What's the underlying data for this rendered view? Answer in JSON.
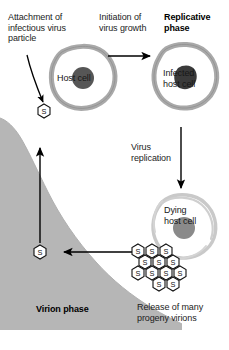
{
  "diagram": {
    "title_semantic": "virus-replication-cycle",
    "labels": {
      "attachment": "Attachment of\ninfectious virus\nparticle",
      "initiation": "Initiation of\nvirus growth",
      "replicative_phase": "Replicative\nphase",
      "host_cell": "Host cell",
      "infected_host_cell": "Infected\nhost cell",
      "virus_replication": "Virus\nreplication",
      "dying_host_cell": "Dying\nhost cell",
      "release": "Release of many\nprogeny virions",
      "virion_phase": "Virion phase"
    },
    "virion_glyph": "S",
    "colors": {
      "background": "#ffffff",
      "gray_field": "#b6b6b6",
      "cell_membrane": "#a9a9a9",
      "cell_membrane_light": "#c9c9c9",
      "nucleus_host": "#565656",
      "nucleus_infected": "#3a3a3a",
      "nucleus_dying": "#8a8a8a",
      "arrow": "#000000",
      "text": "#1a1a1a"
    },
    "virion_cluster_rows": [
      {
        "count": 3,
        "y": 250,
        "x_start": 138,
        "step": 14
      },
      {
        "count": 3,
        "y": 261,
        "x_start": 145,
        "step": 14
      },
      {
        "count": 4,
        "y": 272,
        "x_start": 138,
        "step": 14
      },
      {
        "count": 2,
        "y": 283,
        "x_start": 159,
        "step": 14
      }
    ],
    "free_virions": [
      {
        "name": "attaching-virion",
        "x": 44,
        "y": 111
      },
      {
        "name": "released-virion",
        "x": 40,
        "y": 252
      }
    ],
    "arrows": [
      {
        "name": "arrow-attachment",
        "type": "curved",
        "from": "attachment-label",
        "to": "attaching-virion"
      },
      {
        "name": "arrow-initiation",
        "type": "straight-right",
        "x1": 108,
        "y1": 56,
        "x2": 150,
        "y2": 56
      },
      {
        "name": "arrow-replication",
        "type": "straight-down",
        "x1": 181,
        "y1": 127,
        "x2": 181,
        "y2": 186
      },
      {
        "name": "arrow-release",
        "type": "straight-left",
        "x1": 130,
        "y1": 252,
        "x2": 62,
        "y2": 252
      },
      {
        "name": "arrow-virion-phase",
        "type": "straight-up",
        "x1": 40,
        "y1": 243,
        "x2": 40,
        "y2": 150
      }
    ]
  }
}
